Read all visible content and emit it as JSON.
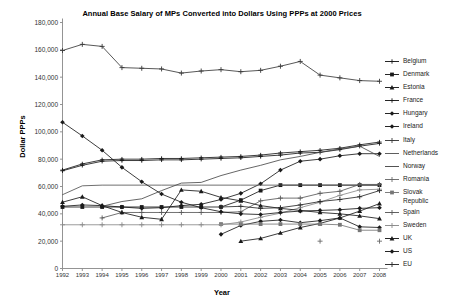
{
  "chart_data": {
    "type": "line",
    "title": "Annual Base Salary of MPs Converted into Dollars Using PPPs at 2000 Prices",
    "xlabel": "Year",
    "ylabel": "Dollar PPPs",
    "grid": false,
    "legend_position": "right",
    "ylim": [
      0,
      180000
    ],
    "yticks": [
      0,
      20000,
      40000,
      60000,
      80000,
      100000,
      120000,
      140000,
      160000,
      180000
    ],
    "ytick_labels": [
      "0",
      "20,000",
      "40,000",
      "60,000",
      "80,000",
      "100,000",
      "120,000",
      "140,000",
      "160,000",
      "180,000"
    ],
    "x": [
      1992,
      1993,
      1994,
      1995,
      1996,
      1997,
      1998,
      1999,
      2000,
      2001,
      2002,
      2003,
      2004,
      2005,
      2006,
      2007,
      2008
    ],
    "categories": [
      "1992",
      "1993",
      "1994",
      "1995",
      "1996",
      "1997",
      "1998",
      "1999",
      "2000",
      "2001",
      "2002",
      "2003",
      "2004",
      "2005",
      "2006",
      "2007",
      "2008"
    ],
    "series": [
      {
        "name": "Belgium",
        "marker": "cross",
        "color": "#1a1a1a",
        "values": [
          72000,
          76500,
          79500,
          80000,
          80000,
          80500,
          80500,
          81000,
          81500,
          82000,
          83000,
          84500,
          85500,
          86500,
          88000,
          90500,
          92500
        ]
      },
      {
        "name": "Denmark",
        "marker": "square",
        "color": "#1a1a1a",
        "values": [
          45000,
          45000,
          45000,
          45000,
          45000,
          45000,
          45000,
          45000,
          45000,
          50000,
          57000,
          61000,
          61000,
          61000,
          61000,
          61000,
          61000
        ]
      },
      {
        "name": "Estonia",
        "marker": "triangle",
        "color": "#1a1a1a",
        "values": [
          null,
          null,
          null,
          null,
          null,
          null,
          null,
          null,
          null,
          20000,
          22000,
          26000,
          30000,
          33000,
          37000,
          42000,
          47500
        ]
      },
      {
        "name": "France",
        "marker": "cross",
        "color": "#1a1a1a",
        "values": [
          71500,
          75500,
          78500,
          79000,
          79000,
          79500,
          79500,
          80000,
          80500,
          81000,
          82000,
          83000,
          84500,
          85000,
          87000,
          89500,
          91500
        ]
      },
      {
        "name": "Hungary",
        "marker": "diamond",
        "color": "#1a1a1a",
        "values": [
          null,
          null,
          null,
          null,
          null,
          null,
          null,
          null,
          25000,
          31500,
          34500,
          35500,
          33500,
          35000,
          37000,
          30500,
          30000
        ]
      },
      {
        "name": "Ireland",
        "marker": "diamond",
        "color": "#1a1a1a",
        "values": [
          45500,
          46500,
          46000,
          45000,
          44000,
          44500,
          46000,
          47000,
          50500,
          55000,
          62000,
          72000,
          78500,
          80000,
          82500,
          84000,
          84000
        ]
      },
      {
        "name": "Italy",
        "marker": "plus",
        "color": "#3a3a3a",
        "values": [
          159500,
          164000,
          162500,
          147000,
          146500,
          146000,
          143000,
          144500,
          145500,
          144000,
          145000,
          148000,
          151500,
          141500,
          139500,
          137500,
          137000
        ]
      },
      {
        "name": "Netherlands",
        "marker": "none",
        "color": "#555555",
        "values": [
          54000,
          60500,
          61000,
          61000,
          61000,
          61000,
          61000,
          61000,
          61000,
          61000,
          61000,
          61000,
          61000,
          61000,
          61000,
          61000,
          61000
        ]
      },
      {
        "name": "Norway",
        "marker": "none",
        "color": "#4a4a4a",
        "values": [
          null,
          null,
          45500,
          49000,
          51000,
          57000,
          62500,
          63000,
          68000,
          72000,
          75500,
          79500,
          82000,
          85000,
          87500,
          89500,
          82000
        ]
      },
      {
        "name": "Romania",
        "marker": "plus",
        "color": "#6a6a6a",
        "values": [
          null,
          null,
          null,
          null,
          null,
          null,
          null,
          null,
          null,
          null,
          null,
          null,
          null,
          20000,
          null,
          null,
          20000
        ]
      },
      {
        "name": "Slovak Republic",
        "marker": "square",
        "color": "#777777",
        "values": [
          null,
          null,
          null,
          null,
          null,
          null,
          null,
          null,
          32500,
          32500,
          32500,
          32500,
          32500,
          32500,
          32000,
          28000,
          28000
        ]
      },
      {
        "name": "Spain",
        "marker": "plus",
        "color": "#5a5a5a",
        "values": [
          null,
          null,
          37000,
          41000,
          41000,
          41000,
          41000,
          41000,
          41000,
          41500,
          49500,
          51500,
          51500,
          55000,
          56500,
          61500,
          61500
        ]
      },
      {
        "name": "Sweden",
        "marker": "plus",
        "color": "#8a8a8a",
        "values": [
          32000,
          32000,
          32000,
          32000,
          32000,
          32000,
          32000,
          32000,
          32000,
          34000,
          37500,
          40500,
          44500,
          48500,
          53500,
          57500,
          58000
        ]
      },
      {
        "name": "UK",
        "marker": "triangle",
        "color": "#1a1a1a",
        "values": [
          48500,
          52500,
          46000,
          41000,
          37500,
          36000,
          57500,
          56500,
          52000,
          49500,
          46000,
          44000,
          42500,
          41000,
          40000,
          38500,
          36500
        ]
      },
      {
        "name": "US",
        "marker": "diamond",
        "color": "#1a1a1a",
        "values": [
          107000,
          97000,
          86500,
          74000,
          63500,
          54500,
          48500,
          44500,
          41500,
          40000,
          39500,
          41000,
          42000,
          42500,
          43000,
          44000,
          44500
        ]
      },
      {
        "name": "EU",
        "marker": "plus",
        "color": "#2a2a2a",
        "values": [
          null,
          null,
          null,
          null,
          null,
          null,
          null,
          null,
          45000,
          45500,
          44000,
          44500,
          46500,
          49000,
          50500,
          52500,
          57000
        ]
      }
    ]
  }
}
